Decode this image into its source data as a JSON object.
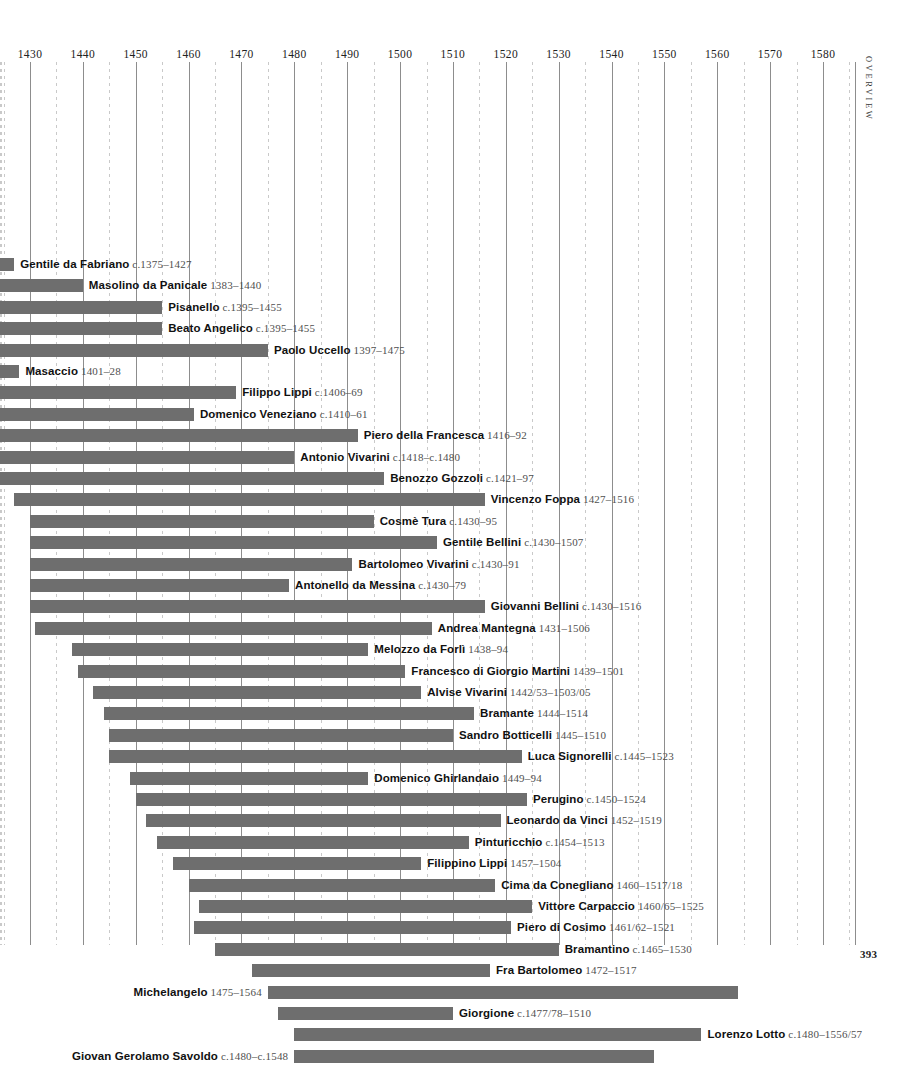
{
  "page": {
    "folio": "393",
    "section_tab": "Overview"
  },
  "chart_data": {
    "type": "bar",
    "orientation": "horizontal",
    "title": "",
    "xlabel": "",
    "ylabel": "",
    "xlim": [
      1420,
      1585
    ],
    "grid": true,
    "major_gridline_step": 10,
    "minor_gridline_step": 5,
    "legend": "none",
    "bar_color": "#6e6e6e",
    "axis_ticks": [
      1430,
      1440,
      1450,
      1460,
      1470,
      1480,
      1490,
      1500,
      1510,
      1520,
      1530,
      1540,
      1550,
      1560,
      1570,
      1580
    ],
    "categories": [
      "Gentile da Fabriano",
      "Masolino da Panicale",
      "Pisanello",
      "Beato Angelico",
      "Paolo Uccello",
      "Masaccio",
      "Filippo Lippi",
      "Domenico Veneziano",
      "Piero della Francesca",
      "Antonio Vivarini",
      "Benozzo Gozzoli",
      "Vincenzo Foppa",
      "Cosmè Tura",
      "Gentile Bellini",
      "Bartolomeo Vivarini",
      "Antonello da Messina",
      "Giovanni Bellini",
      "Andrea Mantegna",
      "Melozzo da Forlì",
      "Francesco di Giorgio Martini",
      "Alvise Vivarini",
      "Bramante",
      "Sandro Botticelli",
      "Luca Signorelli",
      "Domenico Ghirlandaio",
      "Perugino",
      "Leonardo da Vinci",
      "Pinturicchio",
      "Filippino Lippi",
      "Cima da Conegliano",
      "Vittore Carpaccio",
      "Piero di Cosimo",
      "Bramantino",
      "Fra Bartolomeo",
      "Michelangelo",
      "Giorgione",
      "Lorenzo Lotto",
      "Giovan Gerolamo Savoldo"
    ],
    "rows": [
      {
        "name": "Gentile da Fabriano",
        "dates": "c.1375–1427",
        "start": 1375,
        "end": 1427,
        "label_side": "right"
      },
      {
        "name": "Masolino da Panicale",
        "dates": "1383–1440",
        "start": 1383,
        "end": 1440,
        "label_side": "right"
      },
      {
        "name": "Pisanello",
        "dates": "c.1395–1455",
        "start": 1395,
        "end": 1455,
        "label_side": "right"
      },
      {
        "name": "Beato Angelico",
        "dates": "c.1395–1455",
        "start": 1395,
        "end": 1455,
        "label_side": "right"
      },
      {
        "name": "Paolo Uccello",
        "dates": "1397–1475",
        "start": 1397,
        "end": 1475,
        "label_side": "right"
      },
      {
        "name": "Masaccio",
        "dates": "1401–28",
        "start": 1401,
        "end": 1428,
        "label_side": "right"
      },
      {
        "name": "Filippo Lippi",
        "dates": "c.1406–69",
        "start": 1406,
        "end": 1469,
        "label_side": "right"
      },
      {
        "name": "Domenico Veneziano",
        "dates": "c.1410–61",
        "start": 1410,
        "end": 1461,
        "label_side": "right"
      },
      {
        "name": "Piero della Francesca",
        "dates": "1416–92",
        "start": 1416,
        "end": 1492,
        "label_side": "right"
      },
      {
        "name": "Antonio Vivarini",
        "dates": "c.1418–c.1480",
        "start": 1418,
        "end": 1480,
        "label_side": "right"
      },
      {
        "name": "Benozzo Gozzoli",
        "dates": "c.1421–97",
        "start": 1421,
        "end": 1497,
        "label_side": "right"
      },
      {
        "name": "Vincenzo Foppa",
        "dates": "1427–1516",
        "start": 1427,
        "end": 1516,
        "label_side": "right"
      },
      {
        "name": "Cosmè Tura",
        "dates": "c.1430–95",
        "start": 1430,
        "end": 1495,
        "label_side": "right"
      },
      {
        "name": "Gentile Bellini",
        "dates": "c.1430–1507",
        "start": 1430,
        "end": 1507,
        "label_side": "right"
      },
      {
        "name": "Bartolomeo Vivarini",
        "dates": "c.1430–91",
        "start": 1430,
        "end": 1491,
        "label_side": "right"
      },
      {
        "name": "Antonello da Messina",
        "dates": "c.1430–79",
        "start": 1430,
        "end": 1479,
        "label_side": "right"
      },
      {
        "name": "Giovanni Bellini",
        "dates": "c.1430–1516",
        "start": 1430,
        "end": 1516,
        "label_side": "right"
      },
      {
        "name": "Andrea Mantegna",
        "dates": "1431–1506",
        "start": 1431,
        "end": 1506,
        "label_side": "right"
      },
      {
        "name": "Melozzo da Forlì",
        "dates": "1438–94",
        "start": 1438,
        "end": 1494,
        "label_side": "right"
      },
      {
        "name": "Francesco di Giorgio Martini",
        "dates": "1439–1501",
        "start": 1439,
        "end": 1501,
        "label_side": "right"
      },
      {
        "name": "Alvise Vivarini",
        "dates": "1442/53–1503/05",
        "start": 1442,
        "end": 1504,
        "label_side": "right"
      },
      {
        "name": "Bramante",
        "dates": "1444–1514",
        "start": 1444,
        "end": 1514,
        "label_side": "right"
      },
      {
        "name": "Sandro Botticelli",
        "dates": "1445–1510",
        "start": 1445,
        "end": 1510,
        "label_side": "right"
      },
      {
        "name": "Luca Signorelli",
        "dates": "c.1445–1523",
        "start": 1445,
        "end": 1523,
        "label_side": "right"
      },
      {
        "name": "Domenico Ghirlandaio",
        "dates": "1449–94",
        "start": 1449,
        "end": 1494,
        "label_side": "right"
      },
      {
        "name": "Perugino",
        "dates": "c.1450–1524",
        "start": 1450,
        "end": 1524,
        "label_side": "right"
      },
      {
        "name": "Leonardo da Vinci",
        "dates": "1452–1519",
        "start": 1452,
        "end": 1519,
        "label_side": "right"
      },
      {
        "name": "Pinturicchio",
        "dates": "c.1454–1513",
        "start": 1454,
        "end": 1513,
        "label_side": "right"
      },
      {
        "name": "Filippino Lippi",
        "dates": "1457–1504",
        "start": 1457,
        "end": 1504,
        "label_side": "right"
      },
      {
        "name": "Cima da Conegliano",
        "dates": "1460–1517/18",
        "start": 1460,
        "end": 1518,
        "label_side": "right"
      },
      {
        "name": "Vittore Carpaccio",
        "dates": "1460/65–1525",
        "start": 1462,
        "end": 1525,
        "label_side": "right"
      },
      {
        "name": "Piero di Cosimo",
        "dates": "1461/62–1521",
        "start": 1461,
        "end": 1521,
        "label_side": "right"
      },
      {
        "name": "Bramantino",
        "dates": "c.1465–1530",
        "start": 1465,
        "end": 1530,
        "label_side": "right"
      },
      {
        "name": "Fra Bartolomeo",
        "dates": "1472–1517",
        "start": 1472,
        "end": 1517,
        "label_side": "right"
      },
      {
        "name": "Michelangelo",
        "dates": "1475–1564",
        "start": 1475,
        "end": 1564,
        "label_side": "left"
      },
      {
        "name": "Giorgione",
        "dates": "c.1477/78–1510",
        "start": 1477,
        "end": 1510,
        "label_side": "right"
      },
      {
        "name": "Lorenzo Lotto",
        "dates": "c.1480–1556/57",
        "start": 1480,
        "end": 1557,
        "label_side": "right"
      },
      {
        "name": "Giovan Gerolamo Savoldo",
        "dates": "c.1480–c.1548",
        "start": 1480,
        "end": 1548,
        "label_side": "left"
      }
    ]
  }
}
